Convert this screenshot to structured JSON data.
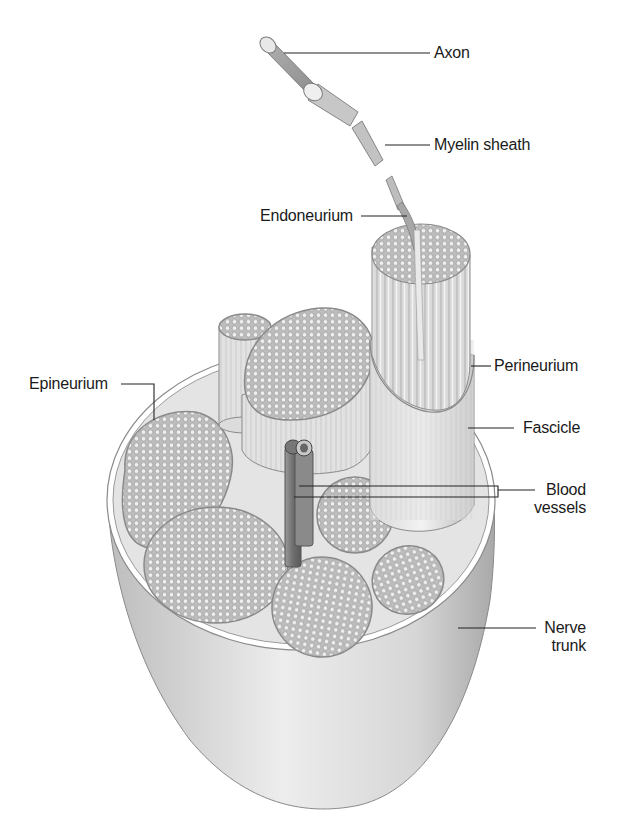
{
  "diagram": {
    "colors": {
      "outline": "#7a7a7a",
      "fill_light": "#e6e6e6",
      "fill_mid": "#cfcfcf",
      "fill_dark": "#9a9a9a",
      "leader_line": "#222222",
      "text": "#1a1a1a"
    },
    "labels": {
      "axon": "Axon",
      "myelin_sheath": "Myelin sheath",
      "endoneurium": "Endoneurium",
      "perineurium": "Perineurium",
      "epineurium": "Epineurium",
      "fascicle": "Fascicle",
      "blood_vessels_line1": "Blood",
      "blood_vessels_line2": "vessels",
      "nerve_trunk_line1": "Nerve",
      "nerve_trunk_line2": "trunk"
    }
  }
}
